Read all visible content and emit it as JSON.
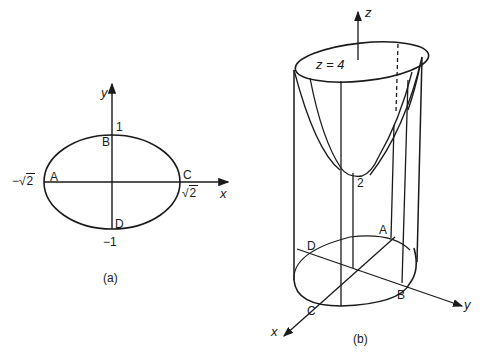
{
  "figure_a": {
    "caption": "(a)",
    "axes": {
      "x": "x",
      "y": "y"
    },
    "ticks": {
      "y_top": "1",
      "y_bottom": "−1",
      "x_left_prefix": "−√",
      "x_left_num": "2",
      "x_right_prefix": "√",
      "x_right_num": "2"
    },
    "points": {
      "A": "A",
      "B": "B",
      "C": "C",
      "D": "D"
    }
  },
  "figure_b": {
    "caption": "(b)",
    "axes": {
      "x": "x",
      "y": "y",
      "z": "z"
    },
    "top_label": "z = 4",
    "vertex_label": "2",
    "points": {
      "A": "A",
      "B": "B",
      "C": "C",
      "D": "D"
    }
  },
  "colors": {
    "ink": "#1a1a1a",
    "background": "#ffffff"
  }
}
